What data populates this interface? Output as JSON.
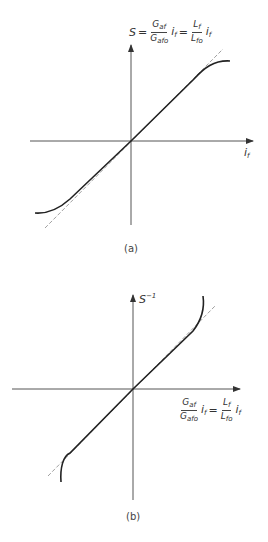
{
  "figure": {
    "panel_a": {
      "caption": "(a)",
      "y_axis_label": {
        "lhs": "S",
        "equals1": "=",
        "frac1_num": "G",
        "frac1_num_sub": "af",
        "frac1_den": "G",
        "frac1_den_sub": "afo",
        "var1": "i",
        "var1_sub": "f",
        "equals2": "=",
        "frac2_num": "L",
        "frac2_num_sub": "f",
        "frac2_den": "L",
        "frac2_den_sub": "fo",
        "var2": "i",
        "var2_sub": "f"
      },
      "x_axis_label": {
        "var": "i",
        "sub": "f"
      },
      "curve": "saturating S-curve through origin (solid)",
      "asymptote": "linear tangent at origin (dashed)"
    },
    "panel_b": {
      "caption": "(b)",
      "y_axis_label": {
        "base": "S",
        "sup": "−1"
      },
      "x_axis_label": {
        "frac1_num": "G",
        "frac1_num_sub": "af",
        "frac1_den": "G",
        "frac1_den_sub": "afo",
        "var1": "i",
        "var1_sub": "f",
        "equals": "=",
        "frac2_num": "L",
        "frac2_num_sub": "f",
        "frac2_den": "L",
        "frac2_den_sub": "fo",
        "var2": "i",
        "var2_sub": "f"
      },
      "curve": "inverse curve through origin, steepening at ends (solid)",
      "asymptote": "linear tangent at origin (dashed)"
    },
    "colors": {
      "curve": "#222222",
      "axis": "#555555",
      "dashed": "#888888"
    }
  }
}
